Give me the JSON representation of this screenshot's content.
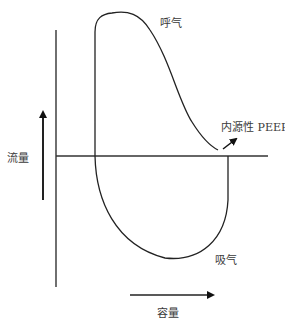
{
  "diagram": {
    "type": "flow-volume-loop",
    "labels": {
      "expiration": "呼气",
      "inspiration": "吸气",
      "intrinsic_peep": "内源性 PEEP",
      "flow_axis": "流量",
      "volume_axis": "容量"
    },
    "colors": {
      "stroke": "#222222",
      "background": "#ffffff"
    }
  }
}
